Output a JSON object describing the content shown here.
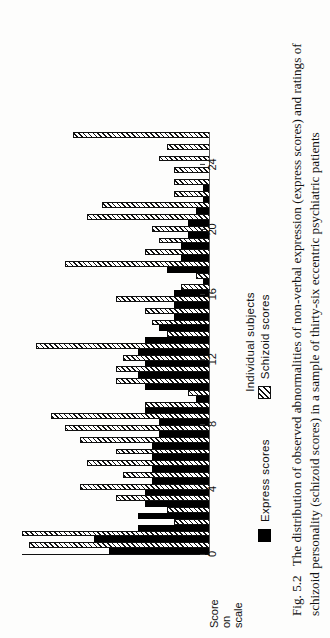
{
  "figure": {
    "number_label": "Fig. 5.2",
    "caption": "The distribution of observed abnormalities of non-verbal expression (express scores) and ratings of schizoid personality (schizoid scores) in a sample of thirty-six eccentric psychiatric patients"
  },
  "legend": {
    "position": "below-axis",
    "items": [
      {
        "label": "Express scores",
        "swatch": "solid-black-square-icon",
        "color": "#000000"
      },
      {
        "label": "Schizoid scores",
        "swatch": "diagonal-hatched-square-icon",
        "color": "#111111"
      }
    ]
  },
  "axes": {
    "value_axis_label": "Score on scale",
    "value_axis_label_lines": [
      "Score",
      "on",
      "scale"
    ],
    "category_axis_label": "Individual subjects",
    "tick_labels": [
      "0",
      "4",
      "8",
      "12",
      "16",
      "20",
      "24"
    ]
  },
  "chart_data": {
    "type": "bar",
    "orientation": "horizontal",
    "title": "",
    "xlabel": "Score on scale",
    "ylabel": "Individual subjects",
    "xlim": [
      0,
      26
    ],
    "grid": false,
    "legend_position": "bottom",
    "categories": [
      "1",
      "2",
      "3",
      "4",
      "5",
      "6",
      "7",
      "8",
      "9",
      "10",
      "11",
      "12",
      "13",
      "14",
      "15",
      "16",
      "17",
      "18",
      "19",
      "20",
      "21",
      "22",
      "23",
      "24",
      "25",
      "26",
      "27",
      "28",
      "29",
      "30",
      "31",
      "32",
      "33",
      "34",
      "35",
      "36"
    ],
    "series": [
      {
        "name": "Express scores",
        "color": "#000000",
        "values": [
          14,
          16,
          10,
          10,
          9,
          9,
          8,
          8,
          8,
          8,
          7,
          7,
          9,
          2,
          9,
          10,
          9,
          10,
          9,
          7,
          5,
          5,
          5,
          1,
          6,
          4,
          4,
          3,
          3,
          2,
          1,
          1,
          0,
          0,
          0,
          0
        ]
      },
      {
        "name": "Schizoid scores",
        "color": "#111111",
        "values": [
          25,
          26,
          5,
          6,
          13,
          18,
          12,
          17,
          13,
          18,
          20,
          22,
          9,
          3,
          13,
          13,
          12,
          24,
          6,
          8,
          9,
          13,
          4,
          2,
          20,
          9,
          7,
          8,
          17,
          15,
          5,
          5,
          5,
          7,
          6,
          19
        ]
      }
    ]
  }
}
